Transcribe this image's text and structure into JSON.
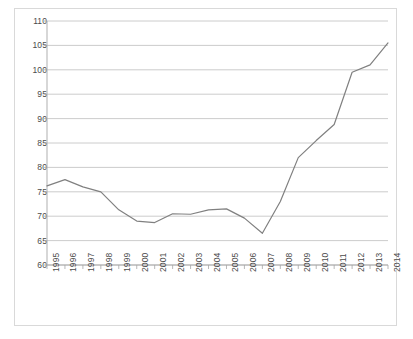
{
  "chart_data": {
    "type": "line",
    "title": "",
    "subtitle": "",
    "xlabel": "",
    "ylabel": "",
    "legend": [],
    "legend_position": "none",
    "grid": true,
    "grid_axis": "y",
    "xlim": [
      1995,
      2014
    ],
    "ylim": [
      60,
      110
    ],
    "ytick_step": 5,
    "yticks": [
      60,
      65,
      70,
      75,
      80,
      85,
      90,
      95,
      100,
      105,
      110
    ],
    "ytick_labels": [
      "60",
      "65",
      "70",
      "75",
      "80",
      "85",
      "90",
      "95",
      "100",
      "105",
      "110"
    ],
    "categories": [
      1995,
      1996,
      1997,
      1998,
      1999,
      2000,
      2001,
      2002,
      2003,
      2004,
      2005,
      2006,
      2007,
      2008,
      2009,
      2010,
      2011,
      2012,
      2013,
      2014
    ],
    "xtick_labels": [
      "1995",
      "1996",
      "1997",
      "1998",
      "1999",
      "2000",
      "2001",
      "2002",
      "2003",
      "2004",
      "2005",
      "2006",
      "2007",
      "2008",
      "2009",
      "2010",
      "2011",
      "2012",
      "2013",
      "2014"
    ],
    "xtick_rotation": -90,
    "series": [
      {
        "name": "series-1",
        "color": "#808080",
        "line_width": 1.2,
        "markers": false,
        "values": [
          76.2,
          77.5,
          76.0,
          75.0,
          71.3,
          69.0,
          68.7,
          70.5,
          70.4,
          71.3,
          71.5,
          69.6,
          66.5,
          73.0,
          82.0,
          85.5,
          88.8,
          99.5,
          101.0,
          105.5
        ]
      }
    ]
  },
  "style": {
    "line_color": "#808080",
    "grid_color": "#bfbfbf",
    "axis_color": "#a6a6a6",
    "border_color": "#d9d9d9",
    "label_color": "#4b4b4b",
    "plot_background": "#ffffff"
  }
}
